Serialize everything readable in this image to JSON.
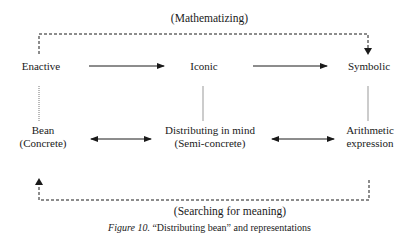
{
  "diagram": {
    "top_loop_label": "(Mathematizing)",
    "bottom_loop_label": "(Searching for meaning)",
    "top_row": [
      {
        "label": "Enactive"
      },
      {
        "label": "Iconic"
      },
      {
        "label": "Symbolic"
      }
    ],
    "bottom_row": [
      {
        "line1": "Bean",
        "line2": "(Concrete)"
      },
      {
        "line1": "Distributing in mind",
        "line2": "(Semi-concrete)"
      },
      {
        "line1": "Arithmetic",
        "line2": "expression"
      }
    ],
    "edges": [
      {
        "from": "Enactive",
        "to": "Iconic",
        "type": "solid-arrow"
      },
      {
        "from": "Iconic",
        "to": "Symbolic",
        "type": "solid-arrow"
      },
      {
        "from": "Bean (Concrete)",
        "to": "Distributing in mind (Semi-concrete)",
        "type": "double-arrow"
      },
      {
        "from": "Distributing in mind (Semi-concrete)",
        "to": "Arithmetic expression",
        "type": "double-arrow"
      },
      {
        "from": "Enactive",
        "to": "Symbolic",
        "type": "dashed-arrow",
        "label": "(Mathematizing)"
      },
      {
        "from": "Arithmetic expression",
        "to": "Bean (Concrete)",
        "type": "dashed-arrow",
        "label": "(Searching for meaning)"
      },
      {
        "from": "Enactive",
        "to": "Bean (Concrete)",
        "type": "dotted-line"
      },
      {
        "from": "Iconic",
        "to": "Distributing in mind (Semi-concrete)",
        "type": "dotted-line"
      },
      {
        "from": "Symbolic",
        "to": "Arithmetic expression",
        "type": "dotted-line"
      }
    ]
  },
  "caption": {
    "figure_label": "Figure 10.",
    "text": " “Distributing bean” and representations"
  }
}
